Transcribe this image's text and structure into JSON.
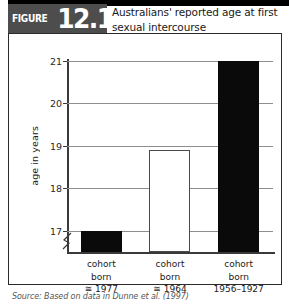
{
  "figure": {
    "label": "FIGURE",
    "number": "12.12",
    "title": "Australians' reported age at first sexual intercourse",
    "source": "Source: Based on data in Dunne et al. (1997)"
  },
  "colors": {
    "tag_background": "#4d4d4d",
    "bar_filled": "#0a0a0a",
    "bar_open_fill": "#ffffff",
    "bar_open_border": "#4a4a4a",
    "gridline": "#8e8e8e",
    "axis": "#3a3a3a",
    "frame_border": "#2b2b2b"
  },
  "icons": {
    "axis_break": "axis-break-icon"
  },
  "chart_data": {
    "type": "bar",
    "title": "Australians' reported age at first sexual intercourse",
    "xlabel": "",
    "ylabel": "age in years",
    "ylim": [
      16.5,
      21
    ],
    "yticks": [
      17,
      18,
      19,
      20,
      21
    ],
    "ytick_labels": [
      "17",
      "18",
      "19",
      "20",
      "21"
    ],
    "grid": true,
    "axis_break": true,
    "axis_break_note": "y-axis broken below 17",
    "legend": "none",
    "categories": [
      "cohort born ≅ 1977",
      "cohort born ≅ 1964",
      "cohort born 1956–1927"
    ],
    "category_lines": [
      [
        "cohort",
        "born",
        "≅ 1977"
      ],
      [
        "cohort",
        "born",
        "≅ 1964"
      ],
      [
        "cohort",
        "born",
        "1956–1927"
      ]
    ],
    "values": [
      17.0,
      18.9,
      21.0
    ],
    "bar_styles": [
      "filled",
      "open",
      "filled"
    ]
  }
}
